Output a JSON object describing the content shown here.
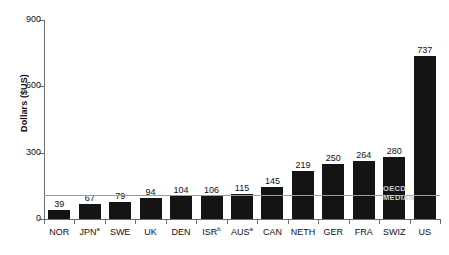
{
  "chart_data": {
    "type": "bar",
    "title": "",
    "xlabel": "",
    "ylabel": "Dollars ($US)",
    "ylim": [
      0,
      900
    ],
    "yticks": [
      0,
      300,
      600,
      900
    ],
    "ytick_labels": [
      "0",
      "300",
      "600",
      "900"
    ],
    "grid": false,
    "legend": "none",
    "categories": [
      "NOR",
      "JPN",
      "SWE",
      "UK",
      "DEN",
      "ISR",
      "AUS",
      "CAN",
      "NETH",
      "GER",
      "FRA",
      "SWIZ",
      "US"
    ],
    "category_footnotes": [
      "",
      "a",
      "",
      "",
      "",
      "b",
      "a",
      "",
      "",
      "",
      "",
      "",
      ""
    ],
    "values": [
      39,
      67,
      79,
      94,
      104,
      106,
      115,
      145,
      219,
      250,
      264,
      280,
      737
    ],
    "value_labels": [
      "39",
      "67",
      "79",
      "94",
      "104",
      "106",
      "115",
      "145",
      "219",
      "250",
      "264",
      "280",
      "737"
    ],
    "annotations": [
      {
        "name": "oecd-median",
        "line1": "OECD",
        "line2": "MEDIAN",
        "value": 110,
        "style": "horizontal-line"
      }
    ],
    "colors": {
      "bar": "#141414",
      "axis": "#6d6d6d",
      "median_line": "#9a9a9a",
      "median_label": "#cfcfcf",
      "background": "#ffffff",
      "text": "#111111"
    }
  }
}
